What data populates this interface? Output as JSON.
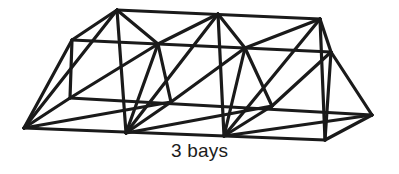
{
  "figure": {
    "name": "space-truss-3-bays",
    "caption": "3 bays",
    "background_color": "#ffffff",
    "line_color": "#1a1a1a",
    "line_width": 3.2,
    "structure": {
      "bays": 3,
      "cross_section": "triangle",
      "top_chords": 2,
      "bottom_chords": 1,
      "vertex_count": 14
    },
    "vertices": {
      "top_front": [
        {
          "id": "TF0",
          "x": 117,
          "y": 10
        },
        {
          "id": "TF1",
          "x": 218,
          "y": 14
        },
        {
          "id": "TF2",
          "x": 320,
          "y": 19
        }
      ],
      "top_back": [
        {
          "id": "TB0",
          "x": 72,
          "y": 40
        },
        {
          "id": "TB1",
          "x": 158,
          "y": 44
        },
        {
          "id": "TB2",
          "x": 245,
          "y": 48
        },
        {
          "id": "TB3",
          "x": 331,
          "y": 52
        }
      ],
      "bottom_front": [
        {
          "id": "BF0",
          "x": 24,
          "y": 128
        },
        {
          "id": "BF1",
          "x": 126,
          "y": 133
        },
        {
          "id": "BF2",
          "x": 224,
          "y": 136
        },
        {
          "id": "BF3",
          "x": 325,
          "y": 140
        }
      ],
      "bottom_back": [
        {
          "id": "BB0",
          "x": 70,
          "y": 98
        },
        {
          "id": "BB1",
          "x": 171,
          "y": 102
        },
        {
          "id": "BB2",
          "x": 272,
          "y": 106
        },
        {
          "id": "BB3",
          "x": 372,
          "y": 115
        }
      ]
    },
    "members": {
      "chords": [
        {
          "name": "top-front-chord",
          "from": "TF0",
          "to": "TF2"
        },
        {
          "name": "top-back-chord",
          "from": "TB0",
          "to": "TB3"
        },
        {
          "name": "bottom-front-chord",
          "from": "BF0",
          "to": "BF3"
        },
        {
          "name": "bottom-back-chord",
          "from": "BB0",
          "to": "BB3"
        }
      ],
      "end_faces": [
        {
          "name": "left-end-face",
          "path": "BF0-TB0-BB0-BF0"
        },
        {
          "name": "right-end-face",
          "path": "BF3-TB3-BB3-BF3"
        }
      ]
    }
  }
}
